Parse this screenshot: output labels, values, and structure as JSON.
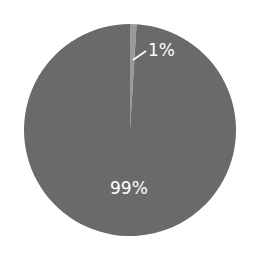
{
  "chart_data": {
    "type": "pie",
    "title": "",
    "categories": [
      "Small segment",
      "Large segment"
    ],
    "values": [
      1,
      99
    ],
    "labels": [
      "1%",
      "99%"
    ],
    "colors": [
      "#9a9a9a",
      "#6a6a6a"
    ],
    "start_angle_deg": 0,
    "legend": "none"
  },
  "labels": {
    "small": "1%",
    "large": "99%"
  }
}
